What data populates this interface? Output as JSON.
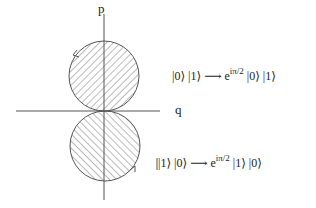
{
  "axes": {
    "vertical_label": "p",
    "horizontal_label": "q"
  },
  "equations": [
    {
      "lhs": "|0⟩ |1⟩",
      "arrow": "⟶",
      "coef": "e",
      "exp": "iπ/2",
      "rhs": "|0⟩ |1⟩"
    },
    {
      "lhs": "|1⟩ |0⟩",
      "arrow": "⟶",
      "coef": "e",
      "exp": "iπ/2",
      "rhs": "|1⟩ |0⟩"
    }
  ],
  "colors": {
    "line": "#555555",
    "hatch": "#666666"
  }
}
